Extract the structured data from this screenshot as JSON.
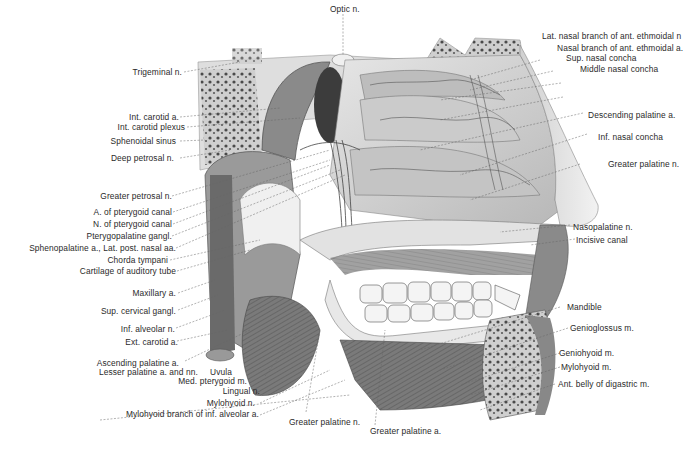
{
  "figure": {
    "colors": {
      "background": "#ffffff",
      "ink": "#2a2a2a",
      "bone": "#d8d8d8",
      "muscle": "#6e6e6e",
      "dark_cavity": "#3c3c3c",
      "teeth": "#f4f4f4"
    }
  },
  "labels": {
    "top": [
      {
        "text": "Optic n."
      }
    ],
    "left": [
      {
        "text": "Trigeminal n."
      },
      {
        "text": "Int. carotid a."
      },
      {
        "text": "Int. carotid plexus"
      },
      {
        "text": "Sphenoidal sinus"
      },
      {
        "text": "Deep petrosal n."
      },
      {
        "text": "Greater petrosal n."
      },
      {
        "text": "A. of pterygoid canal"
      },
      {
        "text": "N. of pterygoid canal"
      },
      {
        "text": "Pterygopalatine gangl."
      },
      {
        "text": "Sphenopalatine a., Lat. post. nasal aa."
      },
      {
        "text": "Chorda tympani"
      },
      {
        "text": "Cartilage of auditory tube"
      },
      {
        "text": "Maxillary a."
      },
      {
        "text": "Sup. cervical gangl."
      },
      {
        "text": "Inf. alveolar n."
      },
      {
        "text": "Ext. carotid a."
      },
      {
        "text": "Ascending palatine a."
      },
      {
        "text": "Lesser palatine a. and nn."
      },
      {
        "text": "Uvula"
      },
      {
        "text": "Med. pterygoid m."
      },
      {
        "text": "Lingual n."
      },
      {
        "text": "Mylohyoid n."
      },
      {
        "text": "Mylohyoid branch of inf. alveolar a."
      }
    ],
    "right": [
      {
        "text": "Lat. nasal branch of ant. ethmoidal n"
      },
      {
        "text": "Nasal branch of ant. ethmoidal a."
      },
      {
        "text": "Sup. nasal concha"
      },
      {
        "text": "Middle nasal concha"
      },
      {
        "text": "Descending palatine a."
      },
      {
        "text": "Inf. nasal concha"
      },
      {
        "text": "Greater palatine n."
      },
      {
        "text": "Nasopalatine n."
      },
      {
        "text": "Incisive canal"
      },
      {
        "text": "Mandible"
      },
      {
        "text": "Genioglossus m."
      },
      {
        "text": "Geniohyoid m."
      },
      {
        "text": "Mylohyoid m."
      },
      {
        "text": "Ant. belly of digastric m."
      }
    ],
    "bottom": [
      {
        "text": "Greater palatine n."
      },
      {
        "text": "Greater palatine a."
      }
    ]
  }
}
